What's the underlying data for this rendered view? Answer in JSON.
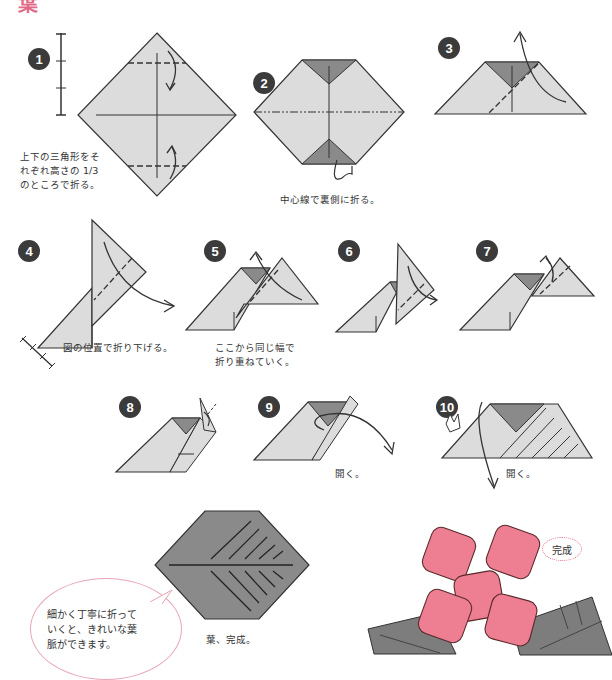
{
  "page": {
    "title": "葉",
    "accent_color": "#e26a87",
    "paper_color": "#dcdcdc",
    "paper_back_color": "#8a8a8a",
    "flower_color": "#ee7f92"
  },
  "steps": [
    {
      "number": "1",
      "caption": "上下の三角形をそ\nれぞれ高さの 1/3\nのところで折る。"
    },
    {
      "number": "2",
      "caption": "中心線で裏側に折る。"
    },
    {
      "number": "3",
      "caption": ""
    },
    {
      "number": "4",
      "caption": "図の位置で折り下げる。"
    },
    {
      "number": "5",
      "caption": "ここから同じ幅で\n折り重ねていく。"
    },
    {
      "number": "6",
      "caption": ""
    },
    {
      "number": "7",
      "caption": ""
    },
    {
      "number": "8",
      "caption": ""
    },
    {
      "number": "9",
      "caption": "開く。"
    },
    {
      "number": "10",
      "caption": "開く。"
    }
  ],
  "finished": {
    "leaf_caption": "葉、完成。",
    "tip_bubble": "細かく丁寧に折って\nいくと、きれいな葉\n脈ができます。",
    "complete_label": "完成"
  }
}
